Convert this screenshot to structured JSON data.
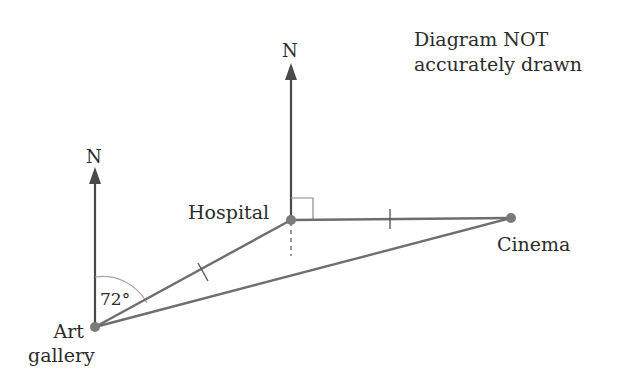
{
  "note": {
    "line1": "Diagram NOT",
    "line2": "accurately drawn"
  },
  "points": {
    "art_gallery": {
      "line1": "Art",
      "line2": "gallery",
      "x": 95,
      "y": 327
    },
    "hospital": {
      "label": "Hospital",
      "x": 291,
      "y": 220
    },
    "cinema": {
      "label": "Cinema",
      "x": 511,
      "y": 218
    }
  },
  "north_arrows": {
    "art_gallery": "N",
    "hospital": "N"
  },
  "angle_label": "72°",
  "colors": {
    "line": "#6e6e6e",
    "point": "#7a7a7a",
    "text": "#2b2b2b",
    "arc": "#a0a0a0"
  }
}
